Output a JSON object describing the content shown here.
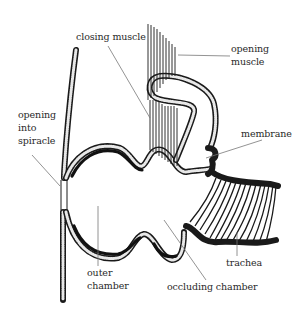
{
  "diagram": {
    "labels": {
      "closing_muscle": "closing muscle",
      "opening_muscle_line1": "opening",
      "opening_muscle_line2": "muscle",
      "opening_spiracle_line1": "opening",
      "opening_spiracle_line2": "into",
      "opening_spiracle_line3": "spiracle",
      "membrane": "membrane",
      "trachea": "trachea",
      "outer_chamber_line1": "outer",
      "outer_chamber_line2": "chamber",
      "occluding_chamber": "occluding chamber"
    },
    "colors": {
      "ink": "#1a1a1a",
      "leader": "#777777",
      "background": "#ffffff"
    }
  }
}
